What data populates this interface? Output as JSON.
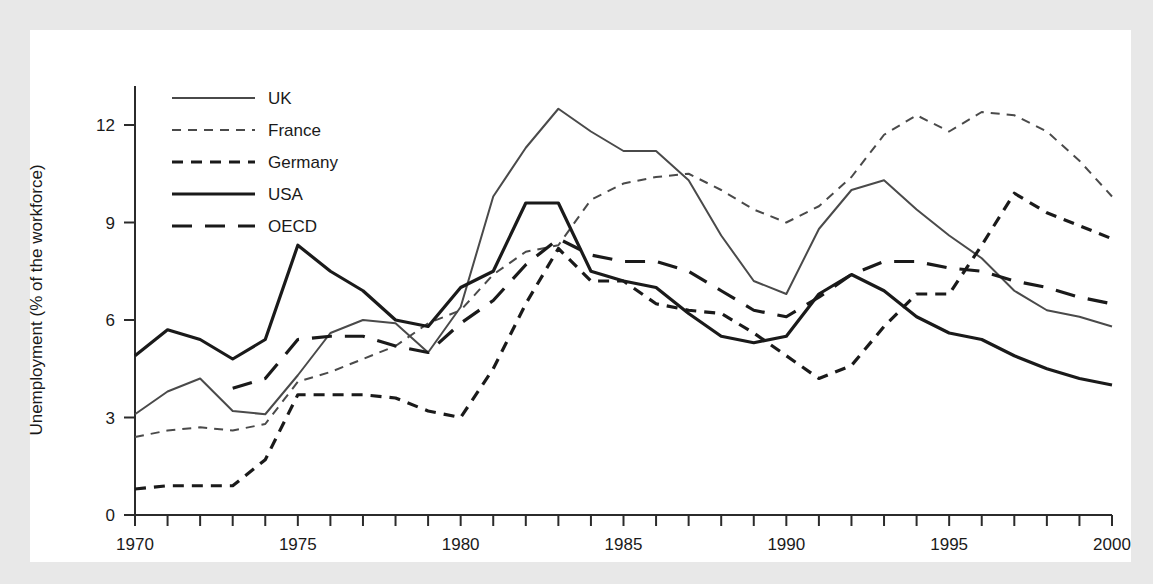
{
  "figure": {
    "background_color": "#ffffff",
    "mat_color": "#e8e8e8",
    "axis_color": "#2b2b2b"
  },
  "axes": {
    "ylabel": "Unemployment (% of the workforce)",
    "xlabel": "",
    "y_ticks": [
      "0",
      "3",
      "6",
      "9",
      "12"
    ],
    "x_ticks": [
      "1970",
      "1975",
      "1980",
      "1985",
      "1990",
      "1995",
      "2000"
    ]
  },
  "legend": {
    "position": "top-left-inside",
    "entries": [
      {
        "label": "UK",
        "style": "solid-thin",
        "color": "#4a4a4a"
      },
      {
        "label": "France",
        "style": "dashed-thin",
        "color": "#4a4a4a"
      },
      {
        "label": "Germany",
        "style": "dashed-bold",
        "color": "#1a1a1a"
      },
      {
        "label": "USA",
        "style": "solid-bold",
        "color": "#1a1a1a"
      },
      {
        "label": "OECD",
        "style": "longdash-bold",
        "color": "#1a1a1a"
      }
    ]
  },
  "chart_data": {
    "type": "line",
    "title": "",
    "xlabel": "",
    "ylabel": "Unemployment (% of the workforce)",
    "xlim": [
      1970,
      2000
    ],
    "ylim": [
      0,
      13.2
    ],
    "y_tick_values": [
      0,
      3,
      6,
      9,
      12
    ],
    "x_tick_values": [
      1970,
      1975,
      1980,
      1985,
      1990,
      1995,
      2000
    ],
    "x_minor_ticks_every": 1,
    "grid": false,
    "legend_position": "upper left",
    "x": [
      1970,
      1971,
      1972,
      1973,
      1974,
      1975,
      1976,
      1977,
      1978,
      1979,
      1980,
      1981,
      1982,
      1983,
      1984,
      1985,
      1986,
      1987,
      1988,
      1989,
      1990,
      1991,
      1992,
      1993,
      1994,
      1995,
      1996,
      1997,
      1998,
      1999,
      2000
    ],
    "series": [
      {
        "name": "UK",
        "style": "solid-thin",
        "color": "#4a4a4a",
        "values": [
          3.1,
          3.8,
          4.2,
          3.2,
          3.1,
          4.3,
          5.6,
          6.0,
          5.9,
          5.0,
          6.4,
          9.8,
          11.3,
          12.5,
          11.8,
          11.2,
          11.2,
          10.3,
          8.6,
          7.2,
          6.8,
          8.8,
          10.0,
          10.3,
          9.4,
          8.6,
          7.9,
          6.9,
          6.3,
          6.1,
          5.8
        ]
      },
      {
        "name": "France",
        "style": "dashed-thin",
        "color": "#4a4a4a",
        "values": [
          2.4,
          2.6,
          2.7,
          2.6,
          2.8,
          4.1,
          4.4,
          4.8,
          5.2,
          5.9,
          6.3,
          7.4,
          8.1,
          8.3,
          9.7,
          10.2,
          10.4,
          10.5,
          10.0,
          9.4,
          9.0,
          9.5,
          10.4,
          11.7,
          12.3,
          11.8,
          12.4,
          12.3,
          11.8,
          10.9,
          9.8
        ]
      },
      {
        "name": "Germany",
        "style": "dashed-bold",
        "color": "#1a1a1a",
        "values": [
          0.8,
          0.9,
          0.9,
          0.9,
          1.7,
          3.7,
          3.7,
          3.7,
          3.6,
          3.2,
          3.0,
          4.5,
          6.5,
          8.2,
          7.2,
          7.2,
          6.5,
          6.3,
          6.2,
          5.6,
          4.9,
          4.2,
          4.6,
          5.8,
          6.8,
          6.8,
          8.3,
          9.9,
          9.3,
          8.9,
          8.5
        ]
      },
      {
        "name": "USA",
        "style": "solid-bold",
        "color": "#1a1a1a",
        "values": [
          4.9,
          5.7,
          5.4,
          4.8,
          5.4,
          8.3,
          7.5,
          6.9,
          6.0,
          5.8,
          7.0,
          7.5,
          9.6,
          9.6,
          7.5,
          7.2,
          7.0,
          6.2,
          5.5,
          5.3,
          5.5,
          6.8,
          7.4,
          6.9,
          6.1,
          5.6,
          5.4,
          4.9,
          4.5,
          4.2,
          4.0
        ]
      },
      {
        "name": "OECD",
        "style": "longdash-bold",
        "color": "#1a1a1a",
        "values": [
          null,
          null,
          null,
          3.9,
          4.2,
          5.4,
          5.5,
          5.5,
          5.2,
          5.0,
          5.9,
          6.6,
          7.7,
          8.5,
          8.0,
          7.8,
          7.8,
          7.5,
          6.9,
          6.3,
          6.1,
          6.7,
          7.4,
          7.8,
          7.8,
          7.6,
          7.5,
          7.2,
          7.0,
          6.7,
          6.5
        ]
      }
    ]
  }
}
